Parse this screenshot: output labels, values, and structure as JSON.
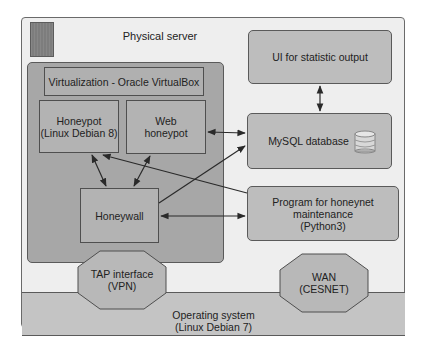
{
  "diagram": {
    "physical_server": {
      "title": "Physical server",
      "icon": "server-icon"
    },
    "virtualization": {
      "label": "Virtualization - Oracle VirtualBox"
    },
    "nodes": {
      "honeypot": {
        "line1": "Honeypot",
        "line2": "(Linux Debian 8)"
      },
      "web_honeypot": {
        "line1": "Web",
        "line2": "honeypot"
      },
      "honeywall": {
        "label": "Honeywall"
      },
      "ui": {
        "label": "UI for statistic output"
      },
      "mysql": {
        "label": "MySQL database",
        "icon": "database-icon"
      },
      "program": {
        "line1": "Program  for honeynet",
        "line2": "maintenance",
        "line3": "(Python3)"
      },
      "tap": {
        "line1": "TAP interface",
        "line2": "(VPN)"
      },
      "wan": {
        "line1": "WAN",
        "line2": "(CESNET)"
      },
      "os": {
        "line1": "Operating system",
        "line2": "(Linux Debian 7)"
      }
    },
    "edges": [
      {
        "from": "honeypot",
        "to": "honeywall",
        "direction": "both"
      },
      {
        "from": "web_honeypot",
        "to": "honeywall",
        "direction": "both"
      },
      {
        "from": "web_honeypot",
        "to": "mysql",
        "direction": "both"
      },
      {
        "from": "ui",
        "to": "mysql",
        "direction": "both"
      },
      {
        "from": "honeywall",
        "to": "mysql",
        "direction": "to"
      },
      {
        "from": "program",
        "to": "honeypot",
        "direction": "to"
      },
      {
        "from": "honeywall",
        "to": "program",
        "direction": "both"
      }
    ],
    "colors": {
      "frame_bg": "#eeeeee",
      "virt_panel": "#a7a7a7",
      "box_fill": "#b3b3b3",
      "rounded_box_fill": "#bdbdbd",
      "os_fill": "#c4c4c4",
      "stroke": "#4f4f4f"
    }
  }
}
